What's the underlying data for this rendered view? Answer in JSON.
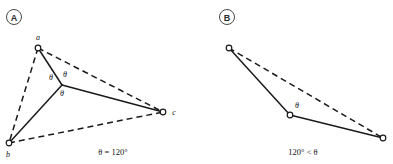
{
  "figure": {
    "background_color": "#ffffff",
    "stroke_color": "#1a1a1a",
    "width": 393,
    "height": 164
  },
  "panel_a": {
    "badge": "A",
    "caption": "θ = 120°",
    "nodes": [
      {
        "id": "a",
        "label": "a",
        "x": 38,
        "y": 48,
        "label_x": 38,
        "label_y": 40
      },
      {
        "id": "b",
        "label": "b",
        "x": 9,
        "y": 143,
        "label_x": 8,
        "label_y": 157
      },
      {
        "id": "c",
        "label": "c",
        "x": 163,
        "y": 112,
        "label_x": 174,
        "label_y": 114
      },
      {
        "id": "s",
        "label": "",
        "x": 62,
        "y": 85,
        "label_x": 0,
        "label_y": 0
      }
    ],
    "steiner_point": {
      "x": 62,
      "y": 85
    },
    "solid_edges": [
      {
        "from": "s",
        "to": "a"
      },
      {
        "from": "s",
        "to": "b"
      },
      {
        "from": "s",
        "to": "c"
      }
    ],
    "dashed_edges": [
      {
        "from": "a",
        "to": "b"
      },
      {
        "from": "a",
        "to": "c"
      },
      {
        "from": "b",
        "to": "c"
      }
    ],
    "angle_labels": [
      {
        "text": "θ",
        "x": 51,
        "y": 80
      },
      {
        "text": "θ",
        "x": 65,
        "y": 77
      },
      {
        "text": "θ",
        "x": 62,
        "y": 96
      }
    ]
  },
  "panel_b": {
    "badge": "B",
    "caption": "120° < θ",
    "nodes": [
      {
        "id": "p",
        "label": "",
        "x": 229,
        "y": 48
      },
      {
        "id": "m",
        "label": "",
        "x": 290,
        "y": 115
      },
      {
        "id": "q",
        "label": "",
        "x": 383,
        "y": 138
      }
    ],
    "solid_edges": [
      {
        "from": "p",
        "to": "m"
      },
      {
        "from": "m",
        "to": "q"
      }
    ],
    "dashed_edges": [
      {
        "from": "p",
        "to": "q"
      }
    ],
    "angle_labels": [
      {
        "text": "θ",
        "x": 297,
        "y": 108
      }
    ]
  }
}
